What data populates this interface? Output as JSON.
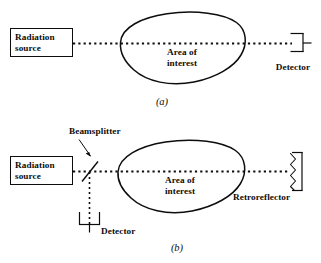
{
  "figure": {
    "type": "optical-path-diagram",
    "background_color": "#ffffff",
    "line_color": "#0d0d0d",
    "panels": [
      {
        "id": "a",
        "caption": "(a)",
        "source_label": "Radiation\nsource",
        "area_label": "Area of\ninterest",
        "detector_label": "Detector",
        "beam_style": "dotted",
        "components": [
          "radiation-source",
          "beam-path",
          "area-of-interest",
          "detector"
        ]
      },
      {
        "id": "b",
        "caption": "(b)",
        "source_label": "Radiation\nsource",
        "area_label": "Area of\ninterest",
        "detector_label": "Detector",
        "beamsplitter_label": "Beamsplitter",
        "retroreflector_label": "Retroreflector",
        "beam_style": "dotted",
        "components": [
          "radiation-source",
          "beamsplitter",
          "beam-path",
          "area-of-interest",
          "retroreflector",
          "detector",
          "return-beam-path"
        ]
      }
    ]
  }
}
